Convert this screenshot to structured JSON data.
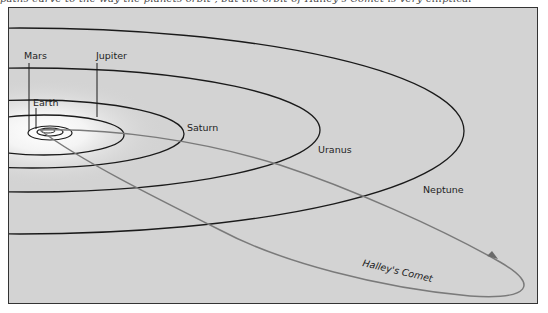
{
  "caption_fragment": "paths curve to the way the planets orbit , but the orbit of Halley's Comet is very elliptical",
  "diagram": {
    "background": "#d4d4d4",
    "frame_color": "#333333",
    "orbit_color": "#1a1a1a",
    "comet_color": "#7a7a7a",
    "labels": {
      "mars": "Mars",
      "jupiter": "Jupiter",
      "earth": "Earth",
      "saturn": "Saturn",
      "uranus": "Uranus",
      "neptune": "Neptune",
      "comet": "Halley's Comet"
    }
  }
}
